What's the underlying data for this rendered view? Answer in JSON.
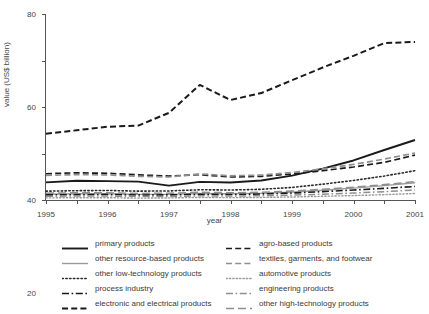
{
  "chart_data": {
    "type": "line",
    "title": "",
    "xlabel": "year",
    "ylabel": "value (US$ billion)",
    "x": [
      1995,
      1996,
      1997,
      1998,
      1999,
      2000,
      2001,
      2002,
      2003,
      2004,
      2005,
      2006,
      2007
    ],
    "xlim": [
      1995,
      2007
    ],
    "ylim": [
      0,
      80
    ],
    "yticks": [
      0,
      20,
      40,
      60,
      80
    ],
    "xticks": [
      "1995",
      "1996",
      "1997",
      "1998",
      "1999",
      "2000",
      "2001",
      "2002",
      "2003",
      "2004",
      "2005",
      "2006",
      "2007"
    ],
    "grid": false,
    "legend_position": "bottom",
    "series": [
      {
        "name": "primary products",
        "color": "#1a1a1a",
        "style": "solid",
        "width": 1.9,
        "values": [
          7.6,
          8.3,
          8.1,
          7.9,
          6.2,
          7.8,
          7.5,
          8.4,
          10.5,
          13.5,
          17.0,
          21.5,
          25.8
        ]
      },
      {
        "name": "other resource-based products",
        "color": "#9a9a9a",
        "style": "solid",
        "width": 1.4,
        "values": [
          2.5,
          2.7,
          2.7,
          2.4,
          2.4,
          2.8,
          2.7,
          2.9,
          3.4,
          4.2,
          5.1,
          6.2,
          7.4
        ]
      },
      {
        "name": "other low-technology products",
        "color": "#2a2a2a",
        "style": "dotted",
        "width": 1.6,
        "values": [
          3.8,
          4.0,
          4.1,
          3.8,
          3.9,
          4.4,
          4.3,
          4.6,
          5.4,
          6.8,
          8.4,
          10.3,
          12.6
        ]
      },
      {
        "name": "process industry",
        "color": "#1a1a1a",
        "style": "dashdot",
        "width": 1.6,
        "values": [
          2.2,
          2.3,
          2.4,
          2.2,
          2.2,
          2.5,
          2.4,
          2.6,
          3.0,
          3.6,
          4.3,
          5.0,
          5.8
        ]
      },
      {
        "name": "electronic and electrical products",
        "color": "#1a1a1a",
        "style": "dashed",
        "width": 2.0,
        "values": [
          28.5,
          30.0,
          31.5,
          32.0,
          37.5,
          49.5,
          43.0,
          46.0,
          51.5,
          57.0,
          62.0,
          67.5,
          68.0
        ]
      },
      {
        "name": "agro-based products",
        "color": "#1a1a1a",
        "style": "dashed",
        "width": 1.7,
        "values": [
          11.3,
          11.7,
          11.5,
          10.8,
          10.3,
          10.9,
          9.9,
          10.2,
          11.2,
          12.6,
          14.2,
          16.2,
          19.3
        ]
      },
      {
        "name": "textiles, garments, and footwear",
        "color": "#8f8f8f",
        "style": "dashed",
        "width": 1.7,
        "values": [
          10.6,
          10.9,
          10.8,
          10.2,
          9.9,
          11.2,
          10.4,
          10.7,
          11.8,
          13.4,
          15.3,
          17.6,
          20.2
        ]
      },
      {
        "name": "automotive products",
        "color": "#9a9a9a",
        "style": "dotted",
        "width": 1.4,
        "values": [
          0.9,
          1.0,
          1.0,
          0.8,
          0.9,
          1.1,
          1.0,
          1.1,
          1.3,
          1.6,
          1.9,
          2.3,
          2.8
        ]
      },
      {
        "name": "engineering products",
        "color": "#8f8f8f",
        "style": "dashdot",
        "width": 1.5,
        "values": [
          1.6,
          1.7,
          1.7,
          1.5,
          1.5,
          1.8,
          1.7,
          1.8,
          2.1,
          2.5,
          3.0,
          3.6,
          4.3
        ]
      },
      {
        "name": "other high-technology products",
        "color": "#8f8f8f",
        "style": "longdash",
        "width": 1.6,
        "values": [
          2.9,
          3.1,
          3.1,
          2.8,
          2.9,
          3.3,
          3.1,
          3.3,
          3.8,
          4.6,
          5.5,
          6.6,
          7.9
        ]
      }
    ],
    "legend_columns": [
      [
        "primary products",
        "other resource-based products",
        "other low-technology products",
        "process industry",
        "electronic and electrical products"
      ],
      [
        "agro-based products",
        "textiles, garments, and footwear",
        "automotive products",
        "engineering products",
        "other high-technology products"
      ]
    ]
  }
}
